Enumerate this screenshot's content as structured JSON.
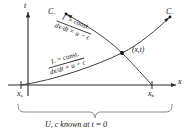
{
  "figure": {
    "background_color": "#ffffff",
    "line_color": "#2b2b2b",
    "text_color": "#111111"
  },
  "axes": {
    "vertical_label": "t",
    "horizontal_label": "x"
  },
  "ticks": {
    "left": {
      "label": "x",
      "subscript": "a"
    },
    "right": {
      "label": "x",
      "subscript": "b"
    }
  },
  "characteristics": {
    "c_minus": {
      "curve_label": "C",
      "curve_subscript": "−",
      "invariant": "I− = const.",
      "invariant_symbol": "I",
      "invariant_subscript": "−",
      "invariant_text": " = const.",
      "slope_equation": "dx/dt = u − c"
    },
    "c_plus": {
      "curve_label": "C",
      "curve_subscript": "+",
      "invariant": "I+ = const.",
      "invariant_symbol": "I",
      "invariant_subscript": "+",
      "invariant_text": " = const.",
      "slope_equation": "dx/dt = u + c"
    }
  },
  "point": {
    "label": "(x,t)"
  },
  "caption": {
    "text": "U, c known at t = 0"
  }
}
